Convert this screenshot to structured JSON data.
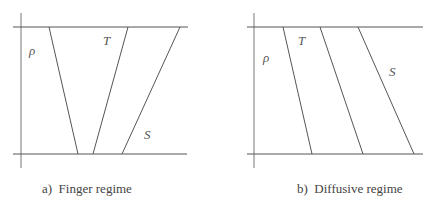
{
  "panels": [
    {
      "id": "a",
      "caption": "a)  Finger regime",
      "axis": {
        "x": 21,
        "y_top": 13,
        "y_bottom": 168
      },
      "top_line": {
        "x1": 13,
        "x2": 188,
        "y": 27
      },
      "bottom_line": {
        "x1": 13,
        "x2": 187,
        "y": 154
      },
      "profiles": [
        {
          "name": "rho",
          "label": "ρ",
          "top_x": 49,
          "bottom_x": 78,
          "label_x": 29,
          "label_y": 55
        },
        {
          "name": "T",
          "label": "T",
          "top_x": 128,
          "bottom_x": 93,
          "label_x": 103,
          "label_y": 45
        },
        {
          "name": "S",
          "label": "S",
          "top_x": 180,
          "bottom_x": 122,
          "label_x": 144,
          "label_y": 139
        }
      ]
    },
    {
      "id": "b",
      "caption": "b)  Diffusive regime",
      "axis": {
        "x": 254,
        "y_top": 13,
        "y_bottom": 168
      },
      "top_line": {
        "x1": 247,
        "x2": 423,
        "y": 27
      },
      "bottom_line": {
        "x1": 247,
        "x2": 423,
        "y": 154
      },
      "profiles": [
        {
          "name": "rho",
          "label": "ρ",
          "top_x": 283,
          "bottom_x": 312,
          "label_x": 263,
          "label_y": 62
        },
        {
          "name": "T",
          "label": "T",
          "top_x": 320,
          "bottom_x": 363,
          "label_x": 298,
          "label_y": 45
        },
        {
          "name": "S",
          "label": "S",
          "top_x": 358,
          "bottom_x": 414,
          "label_x": 389,
          "label_y": 76
        }
      ]
    }
  ],
  "colors": {
    "line": "#555555",
    "axis": "#777777",
    "text": "#444444"
  }
}
